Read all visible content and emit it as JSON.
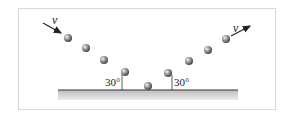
{
  "diagram": {
    "incoming_velocity_label": "v",
    "outgoing_velocity_label": "v",
    "incidence_angle_label": "30°",
    "reflection_angle_label": "30°",
    "ball_count": 9,
    "colors": {
      "ball": "#8a8a8a",
      "surface_line": "#333333",
      "surface_fill": "#c8c8c8",
      "frame": "#d8d8d8"
    }
  }
}
